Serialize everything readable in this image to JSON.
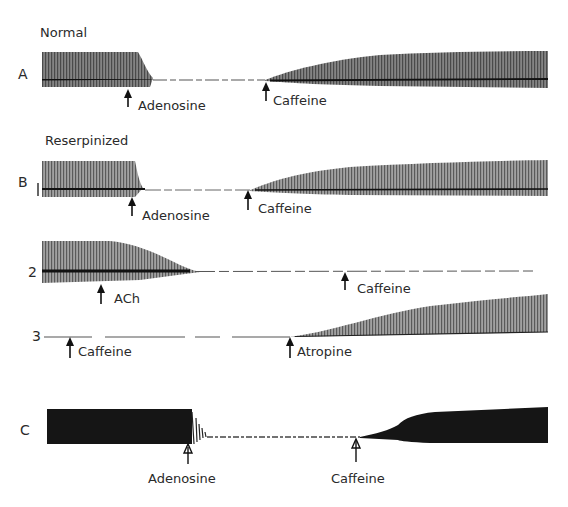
{
  "figure": {
    "panels": [
      {
        "id": "A",
        "condition_label": "Normal",
        "letter": "A",
        "events": [
          {
            "drug": "Adenosine"
          },
          {
            "drug": "Caffeine"
          }
        ]
      },
      {
        "id": "B",
        "condition_label": "Reserpinized",
        "letter": "B",
        "traces": [
          {
            "number": "1",
            "events": [
              {
                "drug": "Adenosine"
              },
              {
                "drug": "Caffeine"
              }
            ]
          },
          {
            "number": "2",
            "events": [
              {
                "drug": "ACh"
              },
              {
                "drug": "Caffeine"
              }
            ]
          },
          {
            "number": "3",
            "events": [
              {
                "drug": "Caffeine"
              },
              {
                "drug": "Atropine"
              }
            ]
          }
        ]
      },
      {
        "id": "C",
        "letter": "C",
        "events": [
          {
            "drug": "Adenosine"
          },
          {
            "drug": "Caffeine"
          }
        ]
      }
    ],
    "colors": {
      "trace": "#2b2b2b",
      "trace_dense": "#111111",
      "background": "#ffffff"
    }
  }
}
